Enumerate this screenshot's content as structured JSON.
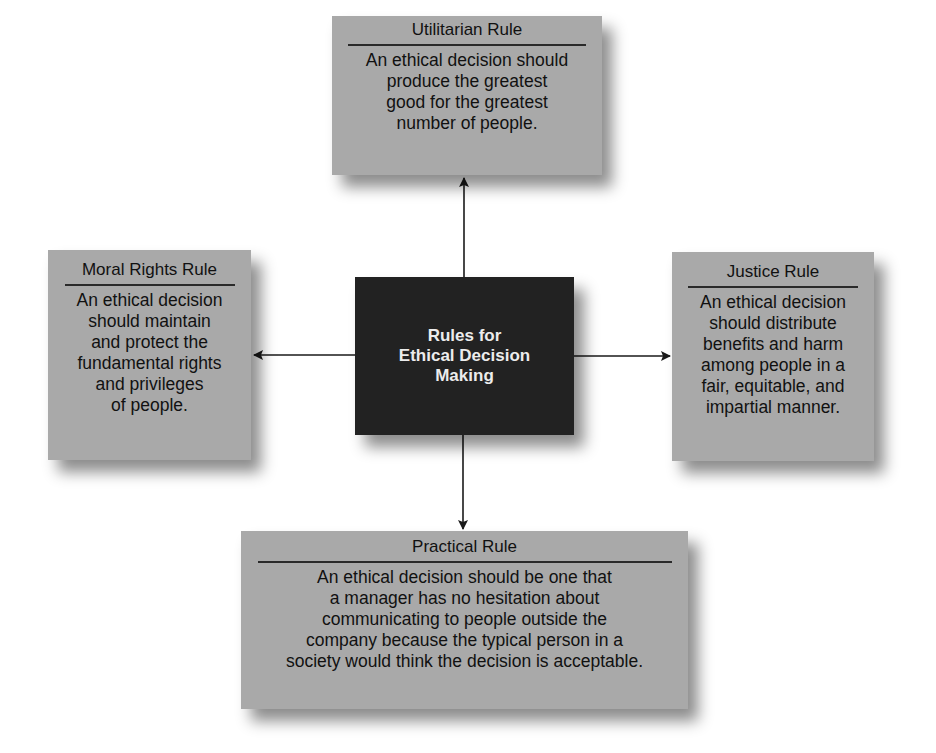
{
  "diagram": {
    "center": {
      "label": "Rules for\nEthical Decision\nMaking"
    },
    "rules": {
      "top": {
        "title": "Utilitarian Rule",
        "description": "An ethical decision should\nproduce the greatest\ngood for the greatest\nnumber of people."
      },
      "left": {
        "title": "Moral Rights Rule",
        "description": "An ethical decision\nshould maintain\nand protect the\nfundamental rights\nand privileges\nof people."
      },
      "right": {
        "title": "Justice Rule",
        "description": "An ethical decision\nshould distribute\nbenefits and harm\namong people in a\nfair, equitable, and\nimpartial manner."
      },
      "bottom": {
        "title": "Practical Rule",
        "description": "An ethical decision should be one that\na manager has no hesitation about\ncommunicating to people outside the\ncompany because the typical person in a\nsociety would think the decision is acceptable."
      }
    },
    "colors": {
      "box_fill": "#a9a9a9",
      "center_fill": "#222222",
      "center_text": "#ececec",
      "text": "#111111",
      "arrow": "#1a1a1a"
    }
  }
}
